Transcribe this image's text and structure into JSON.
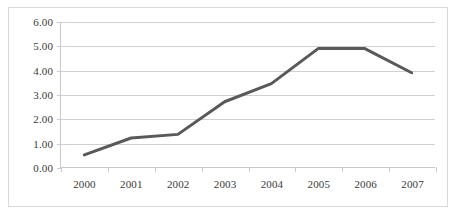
{
  "chart_data": {
    "type": "line",
    "title": "",
    "xlabel": "",
    "ylabel": "",
    "categories": [
      "2000",
      "2001",
      "2002",
      "2003",
      "2004",
      "2005",
      "2006",
      "2007"
    ],
    "values": [
      0.5,
      1.2,
      1.35,
      2.7,
      3.45,
      4.9,
      4.9,
      3.9
    ],
    "series": [
      {
        "name": "",
        "values": [
          0.5,
          1.2,
          1.35,
          2.7,
          3.45,
          4.9,
          4.9,
          3.9
        ],
        "color": "#595959"
      }
    ],
    "ylim": [
      0,
      6
    ],
    "ytick_step": 1,
    "ytick_labels": [
      "0.00",
      "1.00",
      "2.00",
      "3.00",
      "4.00",
      "5.00",
      "6.00"
    ],
    "ytick_values": [
      0,
      1,
      2,
      3,
      4,
      5,
      6
    ],
    "grid": true,
    "grid_axis": "y",
    "legend": false,
    "legend_position": "none",
    "markers": false,
    "line_width": 3,
    "annotations": []
  },
  "style": {
    "line_color": "#595959",
    "grid_color": "#d0d0d0",
    "axis_color": "#c9c9c9",
    "frame_border_color": "#d9d9d9",
    "background": "#ffffff",
    "tick_label_color": "#3a3a3a"
  }
}
